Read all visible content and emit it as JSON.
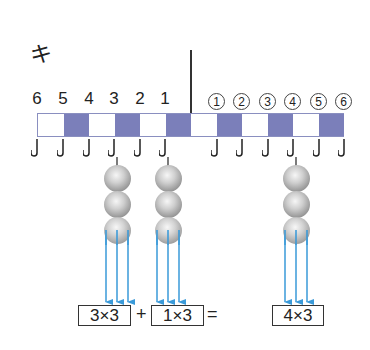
{
  "title": "キ",
  "bar": {
    "cells": [
      "white",
      "blue",
      "white",
      "blue",
      "white",
      "blue",
      "white",
      "blue",
      "white",
      "blue",
      "white",
      "blue"
    ],
    "colors": {
      "blue": "#7b7fba",
      "border": "#8a8fc0"
    }
  },
  "left_labels": [
    "6",
    "5",
    "4",
    "3",
    "2",
    "1"
  ],
  "right_labels": [
    "①",
    "②",
    "③",
    "④",
    "⑤",
    "⑥"
  ],
  "right_label_digits": [
    "1",
    "2",
    "3",
    "4",
    "5",
    "6"
  ],
  "hooks_with_beads": [
    {
      "label": "3",
      "bead_count": 3
    },
    {
      "label": "1",
      "bead_count": 3
    },
    {
      "label": "④",
      "bead_count": 3
    }
  ],
  "arrow_color": "#3a9ad9",
  "equation": {
    "term1": "3×3",
    "plus": "+",
    "term2": "1×3",
    "equals": "=",
    "result": "4×3"
  }
}
